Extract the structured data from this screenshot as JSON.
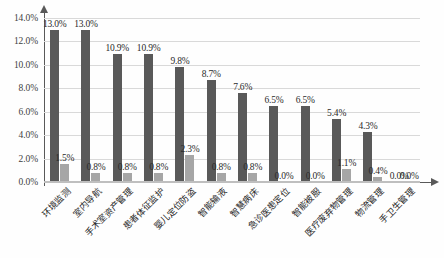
{
  "chart_data": {
    "type": "bar",
    "title": "",
    "subtitle": "",
    "xlabel": "",
    "ylabel": "",
    "ylim": [
      0,
      14
    ],
    "ytick_labels": [
      "0.0%",
      "2.0%",
      "4.0%",
      "6.0%",
      "8.0%",
      "10.0%",
      "12.0%",
      "14.0%"
    ],
    "ytick_values": [
      0,
      2,
      4,
      6,
      8,
      10,
      12,
      14
    ],
    "grid": true,
    "legend_position": "none",
    "categories": [
      "环境监测",
      "室内导航",
      "手术室资产管理",
      "患者体征监护",
      "婴儿定位防盗",
      "智能输液",
      "智慧病床",
      "急诊医患定位",
      "智能被服",
      "医疗废弃物管理",
      "物流管理",
      "手卫生管理"
    ],
    "series": [
      {
        "name": "series-1",
        "color": "#595959",
        "values": [
          13.0,
          13.0,
          10.9,
          10.9,
          9.8,
          8.7,
          7.6,
          6.5,
          6.5,
          5.4,
          4.3,
          0.0
        ],
        "labels": [
          "13.0%",
          "13.0%",
          "10.9%",
          "10.9%",
          "9.8%",
          "8.7%",
          "7.6%",
          "6.5%",
          "6.5%",
          "5.4%",
          "4.3%",
          "0.0%"
        ]
      },
      {
        "name": "series-2",
        "color": "#a6a6a6",
        "values": [
          1.5,
          0.8,
          0.8,
          0.8,
          2.3,
          0.8,
          0.8,
          0.0,
          0.0,
          1.1,
          0.4,
          0.0
        ],
        "labels": [
          "1.5%",
          "0.8%",
          "0.8%",
          "0.8%",
          "2.3%",
          "0.8%",
          "0.8%",
          "0.0%",
          "0.0%",
          "1.1%",
          "0.4%",
          "0.0%"
        ]
      }
    ]
  },
  "colors": {
    "series1": "#595959",
    "series2": "#a6a6a6",
    "gridline": "#d9d9d9",
    "axis": "#595959",
    "background": "#ffffff"
  }
}
